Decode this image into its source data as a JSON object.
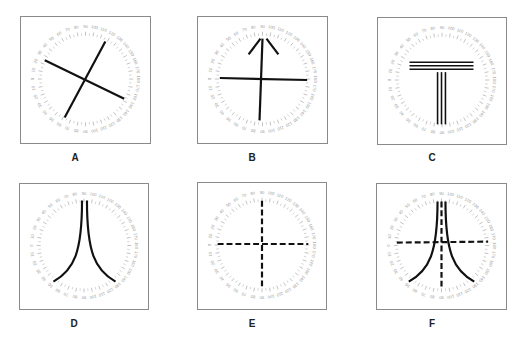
{
  "figure": {
    "dial": {
      "labels": [
        "0",
        "10",
        "20",
        "30",
        "40",
        "50",
        "60",
        "70",
        "80",
        "90",
        "100",
        "110",
        "120",
        "130",
        "140",
        "150",
        "160",
        "170",
        "180"
      ],
      "tick_color": "#a8a8a8",
      "label_color": "#9a9a9a",
      "line_color": "#111111"
    },
    "panels": [
      {
        "id": "A",
        "label": "A",
        "pattern": "oblique-cross",
        "box": {
          "x": 20,
          "y": 16,
          "w": 131,
          "h": 128
        },
        "label_pos": {
          "x": 75,
          "y": 152
        }
      },
      {
        "id": "B",
        "label": "B",
        "pattern": "cross-with-arrowhead",
        "box": {
          "x": 197,
          "y": 16,
          "w": 131,
          "h": 128
        },
        "label_pos": {
          "x": 252,
          "y": 152
        }
      },
      {
        "id": "C",
        "label": "C",
        "pattern": "triple-line-T",
        "box": {
          "x": 377,
          "y": 17,
          "w": 130,
          "h": 128
        },
        "label_pos": {
          "x": 432,
          "y": 152
        }
      },
      {
        "id": "D",
        "label": "D",
        "pattern": "hyperbolic-curves",
        "box": {
          "x": 19,
          "y": 183,
          "w": 130,
          "h": 127
        },
        "label_pos": {
          "x": 74,
          "y": 318
        }
      },
      {
        "id": "E",
        "label": "E",
        "pattern": "dashed-cross",
        "box": {
          "x": 197,
          "y": 182,
          "w": 130,
          "h": 128
        },
        "label_pos": {
          "x": 252,
          "y": 318
        }
      },
      {
        "id": "F",
        "label": "F",
        "pattern": "curves-with-dashed-cross",
        "box": {
          "x": 376,
          "y": 183,
          "w": 131,
          "h": 127
        },
        "label_pos": {
          "x": 432,
          "y": 318
        }
      }
    ]
  }
}
